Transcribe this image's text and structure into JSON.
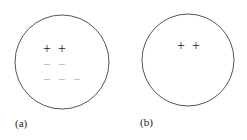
{
  "figure": {
    "panels": [
      {
        "label": "(a)",
        "circle": {
          "cx": 62,
          "cy": 62,
          "r": 47
        },
        "positive_charges": [
          {
            "symbol": "+",
            "x": 47,
            "y": 49
          },
          {
            "symbol": "+",
            "x": 62,
            "y": 49
          }
        ],
        "negative_charges": [
          {
            "symbol": "−",
            "x": 47,
            "y": 65
          },
          {
            "symbol": "−",
            "x": 62,
            "y": 65
          },
          {
            "symbol": "−",
            "x": 47,
            "y": 80
          },
          {
            "symbol": "−",
            "x": 62,
            "y": 80
          },
          {
            "symbol": "−",
            "x": 77,
            "y": 80
          }
        ]
      },
      {
        "label": "(b)",
        "circle": {
          "cx": 188,
          "cy": 60,
          "r": 46
        },
        "positive_charges": [
          {
            "symbol": "+",
            "x": 181,
            "y": 46
          },
          {
            "symbol": "+",
            "x": 196,
            "y": 46
          }
        ],
        "negative_charges": []
      }
    ],
    "colors": {
      "outline": "#555555",
      "positive": "#222222",
      "negative": "#aaaaaa"
    }
  }
}
